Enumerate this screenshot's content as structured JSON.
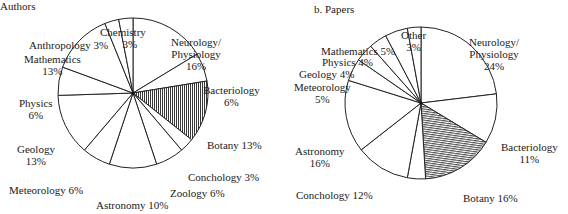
{
  "chart_data": [
    {
      "type": "pie",
      "title": "Authors",
      "categories": [
        "Neurology/Physiology",
        "Bacteriology",
        "Botany",
        "Conchology",
        "Zoology",
        "Astronomy",
        "Meteorology",
        "Geology",
        "Physics",
        "Mathematics",
        "Anthropology",
        "Chemistry"
      ],
      "values": [
        16,
        6,
        13,
        3,
        6,
        10,
        6,
        13,
        6,
        13,
        3,
        3
      ],
      "hatched": "Botany",
      "labels": {
        "neuro1": "Neurology/",
        "neuro2": "Physiology",
        "neuro_pct": "16%",
        "bact": "Bacteriology",
        "bact_pct": "6%",
        "botany": "Botany  13%",
        "conch": "Conchology  3%",
        "zoo": "Zoology  6%",
        "astro": "Astronomy  10%",
        "meteo": "Meteorology   6%",
        "geo": "Geology",
        "geo_pct": "13%",
        "phys": "Physics",
        "phys_pct": "6%",
        "math": "Mathematics",
        "math_pct": "13%",
        "anthro": "Anthropology  3%",
        "chem": "Chemistry",
        "chem_pct": "3%"
      }
    },
    {
      "type": "pie",
      "title": "b. Papers",
      "categories": [
        "Neurology/Physiology",
        "Bacteriology",
        "Botany",
        "Unlabeled",
        "Conchology",
        "Astronomy",
        "Meteorology",
        "Geology",
        "Physics",
        "Mathematics",
        "Other"
      ],
      "values": [
        24,
        11,
        16,
        4,
        12,
        16,
        5,
        4,
        4,
        5,
        3
      ],
      "hatched": "Botany",
      "labels": {
        "neuro1": "Neurology/",
        "neuro2": "Physiology",
        "neuro_pct": "24%",
        "bact": "Bacteriology",
        "bact_pct": "11%",
        "botany": "Botany  16%",
        "conch": "Conchology  12%",
        "astro": "Astronomy",
        "astro_pct": "16%",
        "meteo": "Meteorology",
        "meteo_pct": "5%",
        "geo": "Geology  4%",
        "phys": "Physics  4%",
        "math": "Mathematics  5%",
        "other": "Other",
        "other_pct": "3%"
      }
    }
  ]
}
